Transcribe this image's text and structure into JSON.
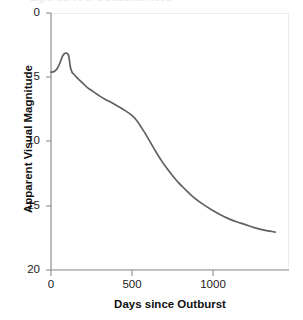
{
  "figure": {
    "clipped_top_text": "Light Curve of a Classical Nova",
    "background_color": "#ffffff",
    "curve_color": "#5f6064",
    "axis_color": "#8c8c90",
    "frame_color": "#ececed"
  },
  "axes": {
    "x_title": "Days since Outburst",
    "y_title": "Apparent Visual Magnitude",
    "x_ticks": [
      "0",
      "500",
      "1000"
    ],
    "y_ticks": [
      "0",
      "5",
      "10",
      "15",
      "20"
    ]
  },
  "chart_data": {
    "type": "line",
    "title": "Light Curve of a Classical Nova",
    "xlabel": "Days since Outburst",
    "ylabel": "Apparent Visual Magnitude",
    "xlim": [
      0,
      1475
    ],
    "ylim": [
      20,
      0
    ],
    "y_inverted": true,
    "grid": false,
    "legend": null,
    "xticks": [
      0,
      500,
      1000
    ],
    "yticks": [
      0,
      5,
      10,
      15,
      20
    ],
    "series": [
      {
        "name": "Nova visual light curve",
        "color": "#5f6064",
        "x": [
          0,
          20,
          40,
          55,
          70,
          80,
          90,
          100,
          110,
          120,
          130,
          140,
          155,
          175,
          200,
          230,
          260,
          300,
          340,
          380,
          420,
          460,
          500,
          530,
          560,
          590,
          620,
          650,
          680,
          710,
          750,
          790,
          830,
          870,
          910,
          950,
          1000,
          1050,
          1100,
          1150,
          1200,
          1260,
          1320,
          1390
        ],
        "y": [
          4.6,
          4.55,
          4.3,
          3.9,
          3.4,
          3.2,
          3.12,
          3.15,
          3.35,
          4.2,
          4.6,
          4.75,
          4.95,
          5.2,
          5.5,
          5.85,
          6.1,
          6.45,
          6.75,
          7.0,
          7.3,
          7.6,
          7.95,
          8.35,
          8.9,
          9.5,
          10.15,
          10.8,
          11.4,
          11.95,
          12.6,
          13.2,
          13.7,
          14.2,
          14.6,
          14.95,
          15.35,
          15.7,
          16.0,
          16.25,
          16.45,
          16.7,
          16.9,
          17.05
        ]
      }
    ]
  }
}
